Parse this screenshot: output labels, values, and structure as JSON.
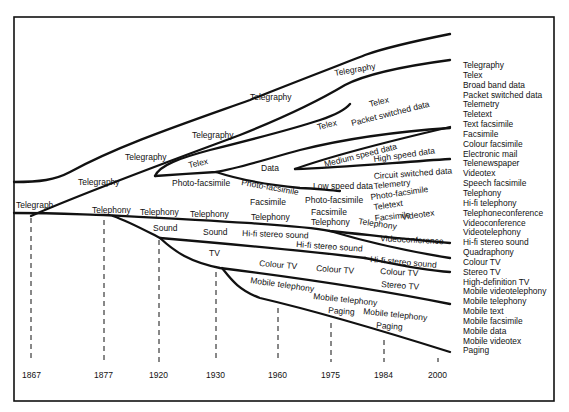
{
  "years": [
    "1867",
    "1877",
    "1920",
    "1930",
    "1960",
    "1975",
    "1984",
    "2000"
  ],
  "labels": {
    "telegraph": "Telegraph",
    "telegraphy1": "Telegraphy",
    "telegraphy2": "Telegraphy",
    "telegraphy3": "Telegraphy",
    "telegraphy4": "Telegraphy",
    "telegraphy5": "Telegraphy",
    "telex1": "Telex",
    "telex2": "Telex",
    "telex3": "Telex",
    "packet": "Packet switched data",
    "data": "Data",
    "medium": "Medium speed data",
    "high": "High speed data",
    "circuit": "Circuit switched data",
    "lowspeed": "Low speed data",
    "telemetry": "Telemetry",
    "photofax1": "Photo-facsimile",
    "photofax2": "Photo-facsimile",
    "photofax3": "Photo-facsimile",
    "photofax4": "Photo-facsimile",
    "teletext": "Teletext",
    "facsimile1": "Facsimile",
    "facsimile2": "Facsimile",
    "facsimile3": "Facsimile",
    "videotex": "Videotex",
    "telephony1": "Telephony",
    "telephony2": "Telephony",
    "telephony3": "Telephony",
    "telephony4": "Telephony",
    "telephony5": "Telephony",
    "telephony6": "Telephony",
    "videoconf": "Videoconference",
    "sound1": "Sound",
    "sound2": "Sound",
    "hifi1": "Hi-fi stereo sound",
    "hifi2": "Hi-fi stereo sound",
    "hifi3": "Hi-fi stereo sound",
    "tv": "TV",
    "colourtv1": "Colour TV",
    "colourtv2": "Colour TV",
    "colourtv3": "Colour TV",
    "stereotv": "Stereo TV",
    "mobile1": "Mobile telephony",
    "mobile2": "Mobile telephony",
    "mobile3": "Mobile telephony",
    "paging1": "Paging",
    "paging2": "Paging"
  },
  "legend": [
    "Telegraphy",
    "Telex",
    "Broad band data",
    "Packet switched data",
    "Telemetry",
    "Teletext",
    "Text facsimile",
    "Facsimile",
    "Colour facsimile",
    "Electronic mail",
    "Telenewspaper",
    "Videotex",
    "Speech facsimile",
    "Telephony",
    "Hi-fi telephony",
    "Telephoneconference",
    "Videoconference",
    "Videotelephony",
    "Hi-fi stereo sound",
    "Quadraphony",
    "Colour TV",
    "Stereo TV",
    "High-definition TV",
    "Mobile videotelephony",
    "Mobile telephony",
    "Mobile text",
    "Mobile facsimile",
    "Mobile data",
    "Mobile videotex",
    "Paging"
  ]
}
